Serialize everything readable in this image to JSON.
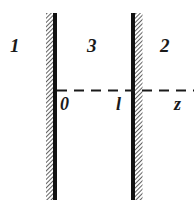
{
  "diagram": {
    "regions": [
      {
        "id": "region-1",
        "label": "1"
      },
      {
        "id": "region-3",
        "label": "3"
      },
      {
        "id": "region-2",
        "label": "2"
      }
    ],
    "axis": {
      "origin_label": "0",
      "thickness_label": "l",
      "axis_label": "z"
    },
    "colors": {
      "plate": "#111111",
      "hatch": "#555555",
      "background": "#ffffff"
    }
  }
}
